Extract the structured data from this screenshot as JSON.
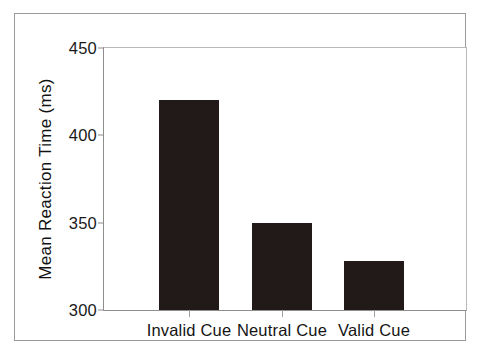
{
  "chart_data": {
    "type": "bar",
    "title": "",
    "subtitle": "",
    "xlabel": "",
    "ylabel": "Mean Reaction Time (ms)",
    "categories": [
      "Invalid Cue",
      "Neutral Cue",
      "Valid Cue"
    ],
    "values": [
      420,
      350,
      328
    ],
    "series": [
      {
        "name": "Mean Reaction Time",
        "values": [
          420,
          350,
          328
        ]
      }
    ],
    "ylim": [
      300,
      450
    ],
    "yticks": [
      300,
      350,
      400,
      450
    ],
    "ytick_labels": [
      "300",
      "350",
      "400",
      "450"
    ],
    "xtick_labels": [
      "Invalid Cue",
      "Neutral Cue",
      "Valid Cue"
    ],
    "grid": false,
    "legend": false,
    "legend_position": "none",
    "bar_color": "#211a18",
    "axis_color": "#8e8e8e",
    "frame_color": "#9a9a9a",
    "background": "#ffffff"
  }
}
